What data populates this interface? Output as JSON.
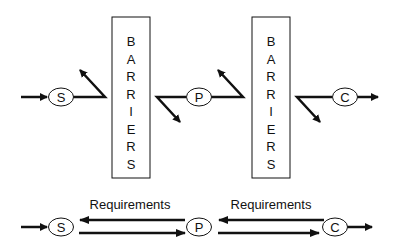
{
  "diagram": {
    "top_row": {
      "nodes": [
        {
          "id": "S",
          "label": "S"
        },
        {
          "id": "P",
          "label": "P"
        },
        {
          "id": "C",
          "label": "C"
        }
      ],
      "barriers": [
        {
          "label": "BARRIERS",
          "letters": [
            "B",
            "A",
            "R",
            "R",
            "I",
            "E",
            "R",
            "S"
          ]
        },
        {
          "label": "BARRIERS",
          "letters": [
            "B",
            "A",
            "R",
            "R",
            "I",
            "E",
            "R",
            "S"
          ]
        }
      ]
    },
    "bottom_row": {
      "nodes": [
        {
          "id": "S",
          "label": "S"
        },
        {
          "id": "P",
          "label": "P"
        },
        {
          "id": "C",
          "label": "C"
        }
      ],
      "labels": [
        "Requirements",
        "Requirements"
      ]
    },
    "colors": {
      "stroke": "#111111",
      "background": "#ffffff"
    }
  }
}
